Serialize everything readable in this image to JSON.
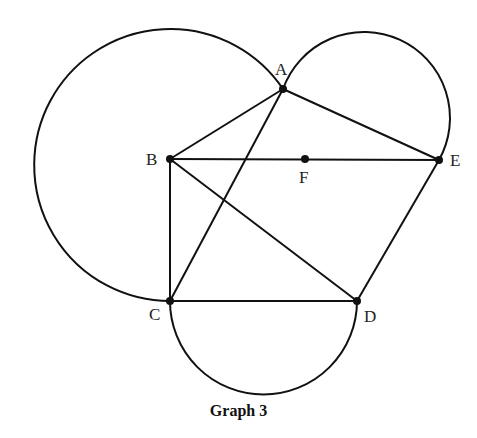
{
  "caption": "Graph 3",
  "points": {
    "A": {
      "label": "A",
      "x": 283,
      "y": 89
    },
    "B": {
      "label": "B",
      "x": 170,
      "y": 159
    },
    "C": {
      "label": "C",
      "x": 170,
      "y": 301
    },
    "D": {
      "label": "D",
      "x": 357,
      "y": 301
    },
    "E": {
      "label": "E",
      "x": 439,
      "y": 160
    },
    "F": {
      "label": "F",
      "x": 305,
      "y": 159
    }
  },
  "segments": [
    "AB",
    "AE",
    "AC",
    "BE",
    "BC",
    "BD",
    "CD",
    "DE"
  ],
  "arcs": [
    {
      "name": "left-arc",
      "from": "A",
      "to": "C",
      "description": "large arc through left side"
    },
    {
      "name": "semicircle-AE",
      "from": "A",
      "to": "E",
      "description": "semicircle on diameter AE"
    },
    {
      "name": "semicircle-CD",
      "from": "C",
      "to": "D",
      "description": "semicircle on diameter CD below"
    }
  ],
  "colors": {
    "stroke": "#111111",
    "background": "#ffffff"
  }
}
